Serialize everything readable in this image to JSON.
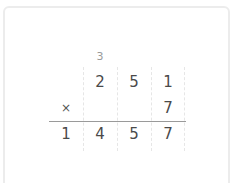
{
  "problem": {
    "type": "long-multiplication",
    "carry_row": [
      "",
      "3",
      "",
      ""
    ],
    "multiplicand_row": [
      "",
      "2",
      "5",
      "1"
    ],
    "multiplier_row": [
      "×",
      "",
      "",
      "7"
    ],
    "result_row": [
      "1",
      "4",
      "5",
      "7"
    ]
  },
  "colors": {
    "digit": "#4a4a4a",
    "carry": "#9a9a9a",
    "rule": "#9a9a9a",
    "grid": "#e6e6e6",
    "card_border": "#ececec"
  }
}
